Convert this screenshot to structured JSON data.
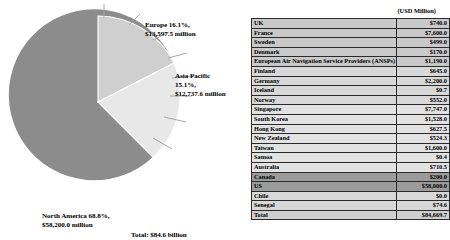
{
  "chart_data": {
    "type": "pie",
    "title": "",
    "units_note": "(USD Million)",
    "total_caption": "Total: $84.6 billion",
    "categories": [
      "North America",
      "Europe",
      "Asia Pacific"
    ],
    "values": [
      58200.0,
      13597.5,
      12737.6
    ],
    "percentages": [
      68.8,
      16.1,
      15.1
    ],
    "slice_colors": [
      "#8c8c8c",
      "#cfcfcf",
      "#e8e8e8"
    ],
    "labels": [
      {
        "name": "north-america",
        "line1": "North America 68.8%,",
        "line2": "$58,200.0 million"
      },
      {
        "name": "europe",
        "line1": "Europe 16.1%,",
        "line2": "$13,597.5 million"
      },
      {
        "name": "asia-pacific",
        "line1": "Asia Pacific",
        "line2": "15.1%,",
        "line3": "$12,737.6 million"
      }
    ]
  },
  "table": {
    "units_header": "(USD Million)",
    "rows": [
      {
        "name": "UK",
        "value": "$740.0",
        "band": "band-a"
      },
      {
        "name": "France",
        "value": "$7,600.0",
        "band": "band-a"
      },
      {
        "name": "Sweden",
        "value": "$499.0",
        "band": "band-a"
      },
      {
        "name": "Denmark",
        "value": "$170.0",
        "band": "band-a"
      },
      {
        "name": "European Air Navigation Service Providers (ANSPs)",
        "value": "$1,190.0",
        "band": "band-a"
      },
      {
        "name": "Finland",
        "value": "$645.0",
        "band": "band-b"
      },
      {
        "name": "Germany",
        "value": "$2,200.0",
        "band": "band-b"
      },
      {
        "name": "Iceland",
        "value": "$0.7",
        "band": "band-b"
      },
      {
        "name": "Norway",
        "value": "$552.0",
        "band": "band-b"
      },
      {
        "name": "Singapore",
        "value": "$7,747.0",
        "band": "band-c"
      },
      {
        "name": "South Korea",
        "value": "$1,528.0",
        "band": "band-c"
      },
      {
        "name": "Hong Kong",
        "value": "$627.5",
        "band": "band-c"
      },
      {
        "name": "New Zealand",
        "value": "$524.3",
        "band": "band-c"
      },
      {
        "name": "Taiwan",
        "value": "$1,600.0",
        "band": "band-c"
      },
      {
        "name": "Samoa",
        "value": "$0.4",
        "band": "band-c"
      },
      {
        "name": "Australia",
        "value": "$710.5",
        "band": "band-c"
      },
      {
        "name": "Canada",
        "value": "$200.0",
        "band": "band-hl"
      },
      {
        "name": "US",
        "value": "$58,000.0",
        "band": "band-hl"
      },
      {
        "name": "Chile",
        "value": "$0.0",
        "band": "band-b"
      },
      {
        "name": "Senegal",
        "value": "$74.6",
        "band": "band-b"
      },
      {
        "name": "Total",
        "value": "$84,669.7",
        "band": "band-total"
      }
    ]
  }
}
